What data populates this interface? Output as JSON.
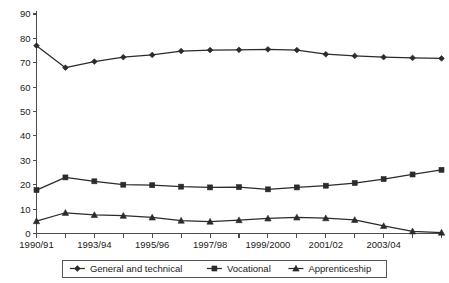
{
  "chart_data": {
    "type": "line",
    "title": "",
    "subtitle": "",
    "xlabel": "",
    "ylabel": "",
    "ylim": [
      0,
      90
    ],
    "ytick_step": 10,
    "grid": false,
    "legend_position": "bottom-center",
    "yticks": [
      "0",
      "10",
      "20",
      "30",
      "40",
      "50",
      "60",
      "70",
      "80",
      "90"
    ],
    "categories": [
      "1990/91",
      "1991/92",
      "1992/93",
      "1993/94",
      "1994/95",
      "1995/96",
      "1996/97",
      "1997/98",
      "1998/99",
      "1999/2000",
      "2000/01",
      "2001/02",
      "2002/03",
      "2003/04",
      "2004/05"
    ],
    "xtick_labels_visible": [
      "1990/91",
      "",
      "1993/94",
      "",
      "1995/96",
      "",
      "1997/98",
      "",
      "1999/2000",
      "",
      "2001/02",
      "",
      "2003/04",
      ""
    ],
    "series": [
      {
        "name": "General and technical",
        "marker": "diamond",
        "values": [
          77.0,
          68.0,
          70.5,
          72.3,
          73.2,
          74.8,
          75.2,
          75.3,
          75.5,
          75.2,
          73.5,
          72.8,
          72.3,
          72.0,
          71.8
        ]
      },
      {
        "name": "Vocational",
        "marker": "square",
        "values": [
          17.8,
          23.0,
          21.4,
          20.0,
          19.8,
          19.2,
          18.9,
          19.0,
          18.1,
          18.9,
          19.6,
          20.7,
          22.3,
          24.2,
          26.1
        ]
      },
      {
        "name": "Apprenticeship",
        "marker": "triangle",
        "values": [
          5.1,
          8.5,
          7.6,
          7.3,
          6.6,
          5.3,
          4.9,
          5.5,
          6.2,
          6.6,
          6.3,
          5.6,
          3.1,
          0.9,
          0.4
        ]
      }
    ]
  },
  "legend": {
    "items": [
      {
        "label": "General and technical",
        "marker": "diamond"
      },
      {
        "label": "Vocational",
        "marker": "square"
      },
      {
        "label": "Apprenticeship",
        "marker": "triangle"
      }
    ]
  }
}
